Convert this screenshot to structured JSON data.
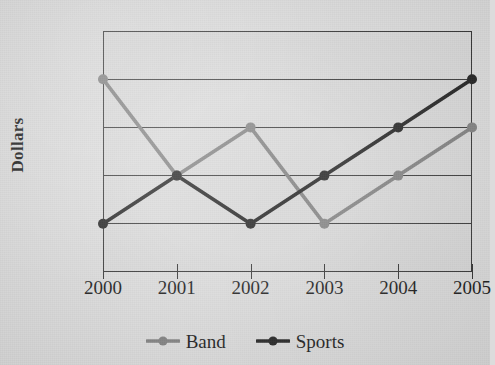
{
  "chart_data": {
    "type": "line",
    "title": "",
    "title_note": "cut off at top edge of image",
    "xlabel": "",
    "ylabel": "Dollars",
    "categories": [
      "2000",
      "2001",
      "2002",
      "2003",
      "2004",
      "2005"
    ],
    "x_tick_labels": [
      "2000",
      "2001",
      "2002",
      "2003",
      "2004",
      "2005"
    ],
    "y_tick_labels": [
      "$7000",
      "6500",
      "6000",
      "5500",
      "5000",
      "4500"
    ],
    "y_tick_values": [
      7000,
      6500,
      6000,
      5500,
      5000,
      4500
    ],
    "ylim": [
      4500,
      7000
    ],
    "y_step": 500,
    "grid": "horizontal",
    "gridline_values": [
      6500,
      6000,
      5500,
      5000
    ],
    "legend_position": "bottom-center",
    "series": [
      {
        "name": "Band",
        "color": "#7d7d7d",
        "values": [
          6500,
          5500,
          6000,
          5000,
          5500,
          6000
        ]
      },
      {
        "name": "Sports",
        "color": "#1c1c1c",
        "values": [
          5000,
          5500,
          5000,
          5500,
          6000,
          6500
        ]
      }
    ]
  },
  "legend": {
    "items": [
      {
        "label": "Band",
        "color": "#7d7d7d"
      },
      {
        "label": "Sports",
        "color": "#1c1c1c"
      }
    ]
  },
  "axes": {
    "y_title": "Dollars"
  },
  "colors": {
    "background": "#dcdcdc",
    "plot_background": "#d6d6d6",
    "axis": "#2d2d2d",
    "band": "#7d7d7d",
    "sports": "#1c1c1c",
    "text": "#141414"
  }
}
